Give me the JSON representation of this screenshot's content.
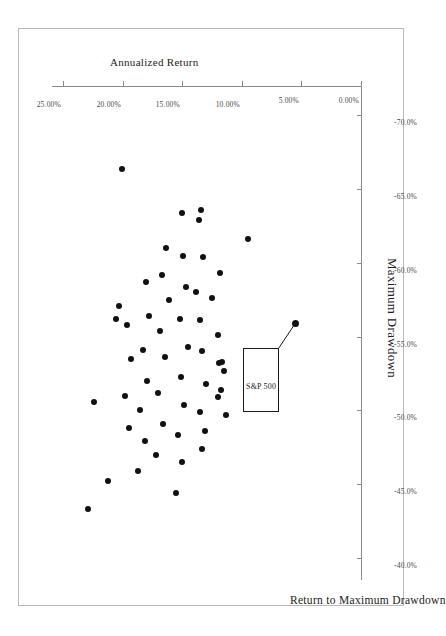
{
  "chart_data": {
    "type": "scatter",
    "title": "Return to Maximum Drawdown",
    "xlabel": "Maximum Drawdown",
    "ylabel": "Annualized Return",
    "xlim": [
      -72.0,
      -38.5
    ],
    "ylim": [
      0.0,
      26.0
    ],
    "y_inverted": true,
    "grid": false,
    "legend": null,
    "xticks": [
      "-70.0%",
      "-65.0%",
      "-60.0%",
      "-55.0%",
      "-50.0%",
      "-45.0%",
      "-40.0%"
    ],
    "xtick_values": [
      -70.0,
      -65.0,
      -60.0,
      -55.0,
      -50.0,
      -45.0,
      -40.0
    ],
    "yticks": [
      "0.00%",
      "5.00%",
      "10.00%",
      "15.00%",
      "20.00%",
      "25.00%"
    ],
    "ytick_values": [
      0.0,
      5.0,
      10.0,
      15.0,
      20.0,
      25.0
    ],
    "annotations": [
      {
        "label": "S&P 500",
        "point_x": -55.9,
        "point_y": 5.6,
        "box_x": -54.2,
        "box_y": 7.0
      }
    ],
    "series": [
      {
        "name": "Funds",
        "marker": "circle",
        "color": "#111111",
        "points": [
          {
            "x": -61.6,
            "y": 9.6
          },
          {
            "x": -59.3,
            "y": 11.9
          },
          {
            "x": -57.6,
            "y": 12.6
          },
          {
            "x": -55.1,
            "y": 12.1
          },
          {
            "x": -53.3,
            "y": 11.7
          },
          {
            "x": -53.2,
            "y": 12.0
          },
          {
            "x": -52.7,
            "y": 11.6
          },
          {
            "x": -51.4,
            "y": 11.8
          },
          {
            "x": -50.9,
            "y": 12.1
          },
          {
            "x": -49.7,
            "y": 11.4
          },
          {
            "x": -63.6,
            "y": 13.5
          },
          {
            "x": -62.9,
            "y": 13.7
          },
          {
            "x": -60.4,
            "y": 13.3
          },
          {
            "x": -58.0,
            "y": 13.9
          },
          {
            "x": -56.1,
            "y": 13.6
          },
          {
            "x": -54.0,
            "y": 13.4
          },
          {
            "x": -51.8,
            "y": 13.1
          },
          {
            "x": -49.9,
            "y": 13.6
          },
          {
            "x": -48.6,
            "y": 13.2
          },
          {
            "x": -47.4,
            "y": 13.4
          },
          {
            "x": -63.4,
            "y": 15.1
          },
          {
            "x": -60.5,
            "y": 15.0
          },
          {
            "x": -58.4,
            "y": 14.8
          },
          {
            "x": -56.2,
            "y": 15.3
          },
          {
            "x": -54.3,
            "y": 14.6
          },
          {
            "x": -52.3,
            "y": 15.2
          },
          {
            "x": -50.4,
            "y": 14.9
          },
          {
            "x": -48.3,
            "y": 15.4
          },
          {
            "x": -46.5,
            "y": 15.1
          },
          {
            "x": -44.4,
            "y": 15.6
          },
          {
            "x": -61.0,
            "y": 16.4
          },
          {
            "x": -59.2,
            "y": 16.8
          },
          {
            "x": -57.5,
            "y": 16.2
          },
          {
            "x": -55.4,
            "y": 16.9
          },
          {
            "x": -53.6,
            "y": 16.5
          },
          {
            "x": -51.2,
            "y": 17.1
          },
          {
            "x": -49.1,
            "y": 16.7
          },
          {
            "x": -47.0,
            "y": 17.3
          },
          {
            "x": -58.7,
            "y": 18.1
          },
          {
            "x": -56.4,
            "y": 17.9
          },
          {
            "x": -54.1,
            "y": 18.4
          },
          {
            "x": -52.0,
            "y": 18.0
          },
          {
            "x": -50.0,
            "y": 18.6
          },
          {
            "x": -47.9,
            "y": 18.2
          },
          {
            "x": -45.9,
            "y": 18.8
          },
          {
            "x": -55.8,
            "y": 19.7
          },
          {
            "x": -53.5,
            "y": 19.4
          },
          {
            "x": -51.0,
            "y": 19.9
          },
          {
            "x": -48.8,
            "y": 19.5
          },
          {
            "x": -66.4,
            "y": 20.1
          },
          {
            "x": -57.1,
            "y": 20.4
          },
          {
            "x": -56.2,
            "y": 20.6
          },
          {
            "x": -45.2,
            "y": 21.3
          },
          {
            "x": -50.6,
            "y": 22.5
          },
          {
            "x": -43.3,
            "y": 23.0
          }
        ]
      }
    ]
  }
}
